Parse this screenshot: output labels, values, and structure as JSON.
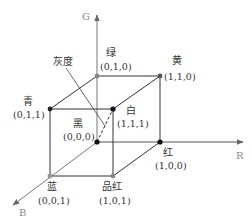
{
  "axes": {
    "g": "G",
    "r": "R",
    "b": "B"
  },
  "vertices": {
    "black": {
      "name": "黑",
      "coord": "(0,0,0)"
    },
    "green": {
      "name": "绿",
      "coord": "(0,1,0)"
    },
    "yellow": {
      "name": "黄",
      "coord": "(1,1,0)"
    },
    "red": {
      "name": "红",
      "coord": "(1,0,0)"
    },
    "cyan": {
      "name": "青",
      "coord": "(0,1,1)"
    },
    "white": {
      "name": "白",
      "coord": "(1,1,1)"
    },
    "blue": {
      "name": "蓝",
      "coord": "(0,0,1)"
    },
    "magenta": {
      "name": "品红",
      "coord": "(1,0,1)"
    }
  },
  "annotations": {
    "grayscale": "灰度"
  },
  "colors": {
    "line": "#333333",
    "axis": "#777777",
    "gray_point": "#999999",
    "dark_point": "#111111"
  }
}
